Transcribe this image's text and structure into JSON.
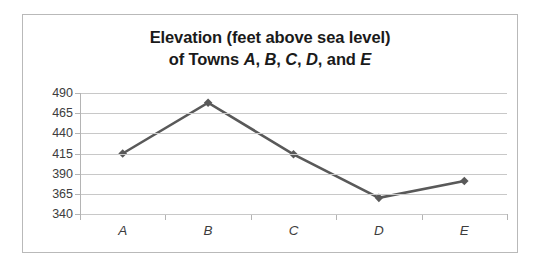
{
  "chart_data": {
    "type": "line",
    "title": "Elevation (feet above sea level) of Towns A, B, C, D, and E",
    "title_lines": [
      "Elevation (feet above sea level)",
      "of Towns A, B, C, D, and E"
    ],
    "title_line1": "Elevation (feet above sea level)",
    "title_line2_prefix": "of Towns ",
    "title_line2_a": "A",
    "title_line2_sep1": ", ",
    "title_line2_b": "B",
    "title_line2_sep2": ", ",
    "title_line2_c": "C",
    "title_line2_sep3": ", ",
    "title_line2_d": "D",
    "title_line2_sep4": ", and ",
    "title_line2_e": "E",
    "categories": [
      "A",
      "B",
      "C",
      "D",
      "E"
    ],
    "values": [
      415,
      478,
      414,
      360,
      381
    ],
    "xlabel": "",
    "ylabel": "",
    "ylim": [
      340,
      490
    ],
    "ytick_step": 25,
    "yticks": [
      490,
      465,
      440,
      415,
      390,
      365,
      340
    ],
    "ytick_labels": [
      "490",
      "465",
      "440",
      "415",
      "390",
      "365",
      "340"
    ],
    "grid": "horizontal",
    "legend": "none",
    "series_color": "#595959",
    "gridline_color": "#c8c8c8",
    "axis_color": "#b4b4b4",
    "marker": "diamond",
    "line_width": 2.6,
    "background": "#ffffff",
    "border_color": "#b9b9b9"
  }
}
